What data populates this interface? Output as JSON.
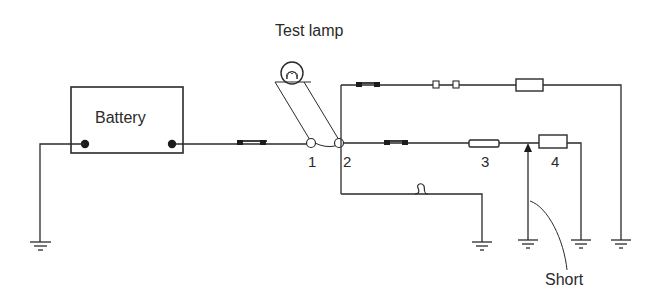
{
  "diagram": {
    "title": "Test lamp",
    "battery_label": "Battery",
    "points": [
      {
        "id": "1",
        "label": "1"
      },
      {
        "id": "2",
        "label": "2"
      },
      {
        "id": "3",
        "label": "3"
      },
      {
        "id": "4",
        "label": "4"
      }
    ],
    "short_label": "Short",
    "colors": {
      "line": "#2a2a2a",
      "background": "#ffffff"
    }
  }
}
